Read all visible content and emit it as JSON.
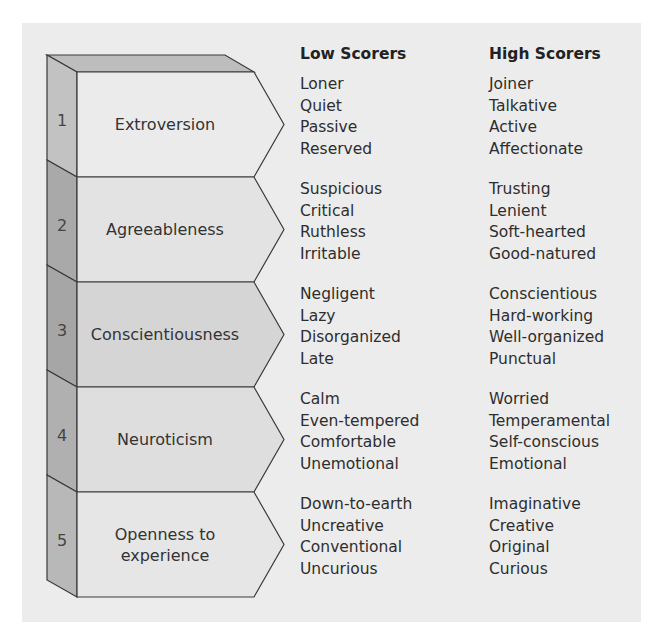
{
  "headers": {
    "low": "Low Scorers",
    "high": "High Scorers"
  },
  "colors": {
    "background": "#ececec",
    "stroke": "#3a3a3a",
    "top_cap": "#bdbdbd",
    "side_faces": [
      "#c2c2c2",
      "#a9a9a9",
      "#a6a6a6",
      "#b0b0b0",
      "#b8b8b8"
    ],
    "front_faces": [
      "#ebebeb",
      "#e3e3e3",
      "#d5d5d5",
      "#dedede",
      "#e6e6e6"
    ]
  },
  "traits": [
    {
      "num": "1",
      "label": "Extroversion",
      "low": [
        "Loner",
        "Quiet",
        "Passive",
        "Reserved"
      ],
      "high": [
        "Joiner",
        "Talkative",
        "Active",
        "Affectionate"
      ]
    },
    {
      "num": "2",
      "label": "Agreeableness",
      "low": [
        "Suspicious",
        "Critical",
        "Ruthless",
        "Irritable"
      ],
      "high": [
        "Trusting",
        "Lenient",
        "Soft-hearted",
        "Good-natured"
      ]
    },
    {
      "num": "3",
      "label": "Conscientiousness",
      "low": [
        "Negligent",
        "Lazy",
        "Disorganized",
        "Late"
      ],
      "high": [
        "Conscientious",
        "Hard-working",
        "Well-organized",
        "Punctual"
      ]
    },
    {
      "num": "4",
      "label": "Neuroticism",
      "low": [
        "Calm",
        "Even-tempered",
        "Comfortable",
        "Unemotional"
      ],
      "high": [
        "Worried",
        "Temperamental",
        "Self-conscious",
        "Emotional"
      ]
    },
    {
      "num": "5",
      "label": "Openness to experience",
      "label_lines": [
        "Openness to",
        "experience"
      ],
      "low": [
        "Down-to-earth",
        "Uncreative",
        "Conventional",
        "Uncurious"
      ],
      "high": [
        "Imaginative",
        "Creative",
        "Original",
        "Curious"
      ]
    }
  ]
}
